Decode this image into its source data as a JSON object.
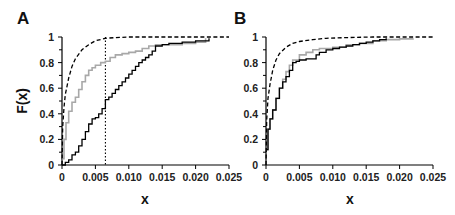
{
  "chart_data": [
    {
      "type": "line",
      "panel": "A",
      "xlabel": "x",
      "ylabel": "F(x)",
      "xlim": [
        0,
        0.025
      ],
      "ylim": [
        0,
        1
      ],
      "xticks": [
        "0",
        "0.005",
        "0.010",
        "0.015",
        "0.020",
        "0.025"
      ],
      "xtick_values": [
        0,
        0.005,
        0.01,
        0.015,
        0.02,
        0.025
      ],
      "yticks": [
        "0",
        "0.2",
        "0.4",
        "0.6",
        "0.8",
        "1"
      ],
      "ytick_values": [
        0,
        0.2,
        0.4,
        0.6,
        0.8,
        1
      ],
      "grid": false,
      "vline": {
        "x": 0.0065,
        "style": "dotted",
        "color": "#000000"
      },
      "series": [
        {
          "name": "theoretical",
          "style": "dashed",
          "color": "#000000",
          "step": false,
          "x": [
            0,
            0.0001,
            0.0003,
            0.0005,
            0.001,
            0.0015,
            0.002,
            0.003,
            0.004,
            0.005,
            0.0065,
            0.008,
            0.01,
            0.015,
            0.025
          ],
          "y": [
            0,
            0.3,
            0.45,
            0.55,
            0.68,
            0.77,
            0.83,
            0.9,
            0.94,
            0.97,
            0.99,
            0.995,
            1.0,
            1.0,
            1.0
          ]
        },
        {
          "name": "empirical-gray",
          "style": "solid",
          "color": "#a8a8a8",
          "step": true,
          "x": [
            0,
            0.0003,
            0.0006,
            0.001,
            0.0015,
            0.002,
            0.0025,
            0.003,
            0.0035,
            0.004,
            0.0045,
            0.005,
            0.0058,
            0.0065,
            0.0072,
            0.008,
            0.009,
            0.01,
            0.011,
            0.012,
            0.013,
            0.014,
            0.016,
            0.018,
            0.02,
            0.0215
          ],
          "y": [
            0.05,
            0.2,
            0.33,
            0.42,
            0.49,
            0.53,
            0.59,
            0.65,
            0.7,
            0.74,
            0.76,
            0.78,
            0.8,
            0.81,
            0.84,
            0.86,
            0.87,
            0.88,
            0.89,
            0.91,
            0.93,
            0.94,
            0.94,
            0.95,
            0.96,
            0.99
          ]
        },
        {
          "name": "empirical-black",
          "style": "solid",
          "color": "#000000",
          "step": true,
          "x": [
            0,
            0.0005,
            0.001,
            0.0015,
            0.002,
            0.0025,
            0.003,
            0.0035,
            0.004,
            0.0045,
            0.005,
            0.0055,
            0.006,
            0.0065,
            0.007,
            0.0075,
            0.008,
            0.0085,
            0.009,
            0.0095,
            0.01,
            0.0105,
            0.011,
            0.0115,
            0.012,
            0.0125,
            0.013,
            0.0135,
            0.014,
            0.015,
            0.016,
            0.018,
            0.02,
            0.022
          ],
          "y": [
            0,
            0.02,
            0.04,
            0.08,
            0.1,
            0.15,
            0.2,
            0.26,
            0.32,
            0.36,
            0.37,
            0.4,
            0.44,
            0.51,
            0.53,
            0.56,
            0.59,
            0.62,
            0.65,
            0.68,
            0.71,
            0.74,
            0.77,
            0.8,
            0.82,
            0.84,
            0.86,
            0.89,
            0.93,
            0.94,
            0.95,
            0.96,
            0.97,
            0.99
          ]
        }
      ]
    },
    {
      "type": "line",
      "panel": "B",
      "xlabel": "x",
      "ylabel": "",
      "xlim": [
        0,
        0.025
      ],
      "ylim": [
        0,
        1
      ],
      "xticks": [
        "0",
        "0.005",
        "0.010",
        "0.015",
        "0.020",
        "0.025"
      ],
      "xtick_values": [
        0,
        0.005,
        0.01,
        0.015,
        0.02,
        0.025
      ],
      "yticks": [
        "0",
        "0.2",
        "0.4",
        "0.6",
        "0.8",
        "1"
      ],
      "ytick_values": [
        0,
        0.2,
        0.4,
        0.6,
        0.8,
        1
      ],
      "grid": false,
      "series": [
        {
          "name": "theoretical",
          "style": "dashed",
          "color": "#000000",
          "step": false,
          "x": [
            0,
            0.0001,
            0.0003,
            0.0006,
            0.001,
            0.0015,
            0.002,
            0.003,
            0.004,
            0.005,
            0.007,
            0.009,
            0.012,
            0.016,
            0.025
          ],
          "y": [
            0,
            0.35,
            0.52,
            0.63,
            0.74,
            0.82,
            0.87,
            0.92,
            0.95,
            0.965,
            0.98,
            0.99,
            0.995,
            1.0,
            1.0
          ]
        },
        {
          "name": "empirical-gray",
          "style": "solid",
          "color": "#a8a8a8",
          "step": true,
          "x": [
            0,
            0.0003,
            0.0006,
            0.001,
            0.0015,
            0.002,
            0.0025,
            0.003,
            0.0035,
            0.004,
            0.005,
            0.006,
            0.007,
            0.008,
            0.01,
            0.012,
            0.014,
            0.016,
            0.018,
            0.02,
            0.022
          ],
          "y": [
            0.12,
            0.28,
            0.36,
            0.43,
            0.52,
            0.6,
            0.67,
            0.73,
            0.78,
            0.82,
            0.86,
            0.88,
            0.9,
            0.91,
            0.92,
            0.94,
            0.95,
            0.97,
            0.98,
            0.985,
            0.99
          ]
        },
        {
          "name": "empirical-black",
          "style": "solid",
          "color": "#000000",
          "step": true,
          "x": [
            0,
            0.0003,
            0.0006,
            0.001,
            0.0015,
            0.002,
            0.0025,
            0.003,
            0.0035,
            0.004,
            0.0045,
            0.005,
            0.006,
            0.007,
            0.0075,
            0.008,
            0.009,
            0.01,
            0.011,
            0.012,
            0.013,
            0.014,
            0.015,
            0.016,
            0.017,
            0.018
          ],
          "y": [
            0.12,
            0.28,
            0.36,
            0.43,
            0.52,
            0.6,
            0.65,
            0.69,
            0.74,
            0.8,
            0.81,
            0.82,
            0.83,
            0.83,
            0.86,
            0.88,
            0.9,
            0.91,
            0.92,
            0.93,
            0.94,
            0.95,
            0.96,
            0.97,
            0.98,
            0.99
          ]
        }
      ]
    }
  ]
}
